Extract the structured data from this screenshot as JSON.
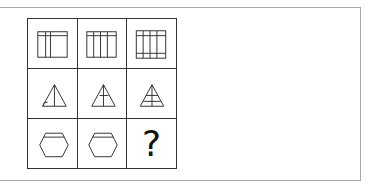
{
  "puzzle": {
    "rows": [
      {
        "shape": "square-grid",
        "cells": [
          {
            "description": "square with 2 vertical lines and 1 horizontal line near top"
          },
          {
            "description": "square with 3 vertical lines and 1 horizontal line near top"
          },
          {
            "description": "square with 3 vertical lines and 2 horizontal lines (top and bottom)"
          }
        ]
      },
      {
        "shape": "triangle",
        "cells": [
          {
            "description": "triangle with vertical median and small corner line at bottom-left"
          },
          {
            "description": "triangle with vertical median and short horizontal line"
          },
          {
            "description": "triangle with vertical median and 2 horizontal lines"
          }
        ]
      },
      {
        "shape": "hexagon",
        "cells": [
          {
            "description": "hexagon with top horizontal band line"
          },
          {
            "description": "hexagon with top horizontal band line"
          },
          {
            "description": "missing"
          }
        ]
      }
    ],
    "missing_label": "?"
  },
  "colors": {
    "line": "#333333",
    "frame": "#a8a8a8",
    "background": "#ffffff"
  }
}
